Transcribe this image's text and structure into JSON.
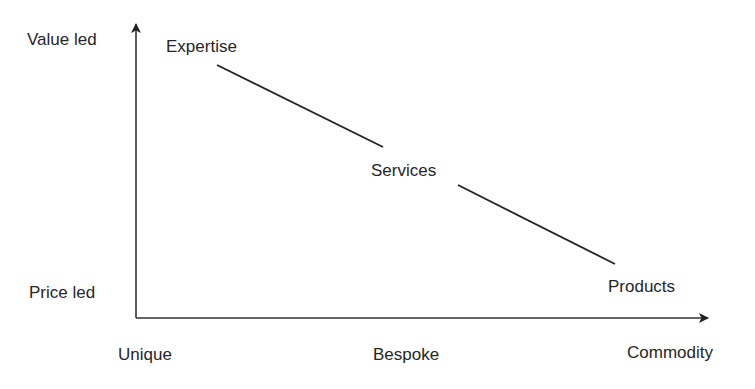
{
  "figure": {
    "caption_partial": "",
    "y_axis": {
      "top_label": "Value led",
      "bottom_label": "Price led"
    },
    "x_axis": {
      "labels": [
        "Unique",
        "Bespoke",
        "Commodity"
      ]
    },
    "nodes": [
      {
        "label": "Expertise"
      },
      {
        "label": "Services"
      },
      {
        "label": "Products"
      }
    ],
    "colors": {
      "line": "#222222",
      "text": "#262626",
      "background": "#ffffff"
    }
  }
}
